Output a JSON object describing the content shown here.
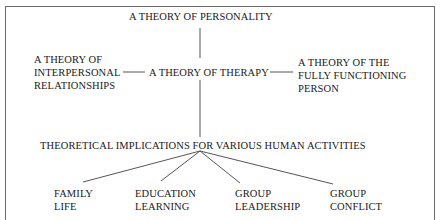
{
  "diagram": {
    "top": "A THEORY OF PERSONALITY",
    "center": "A THEORY OF THERAPY",
    "left": [
      "A THEORY OF",
      "INTERPERSONAL",
      "RELATIONSHIPS"
    ],
    "right": [
      "A THEORY OF THE",
      "FULLY FUNCTIONING",
      "PERSON"
    ],
    "implications": "THEORETICAL IMPLICATIONS FOR VARIOUS HUMAN ACTIVITIES",
    "activities": [
      {
        "line1": "FAMILY",
        "line2": "LIFE"
      },
      {
        "line1": "EDUCATION",
        "line2": "LEARNING"
      },
      {
        "line1": "GROUP",
        "line2": "LEADERSHIP"
      },
      {
        "line1": "GROUP",
        "line2": "CONFLICT"
      }
    ]
  },
  "colors": {
    "line": "#555555",
    "text": "#1a1a1a",
    "frame": "#6a6a6a"
  }
}
